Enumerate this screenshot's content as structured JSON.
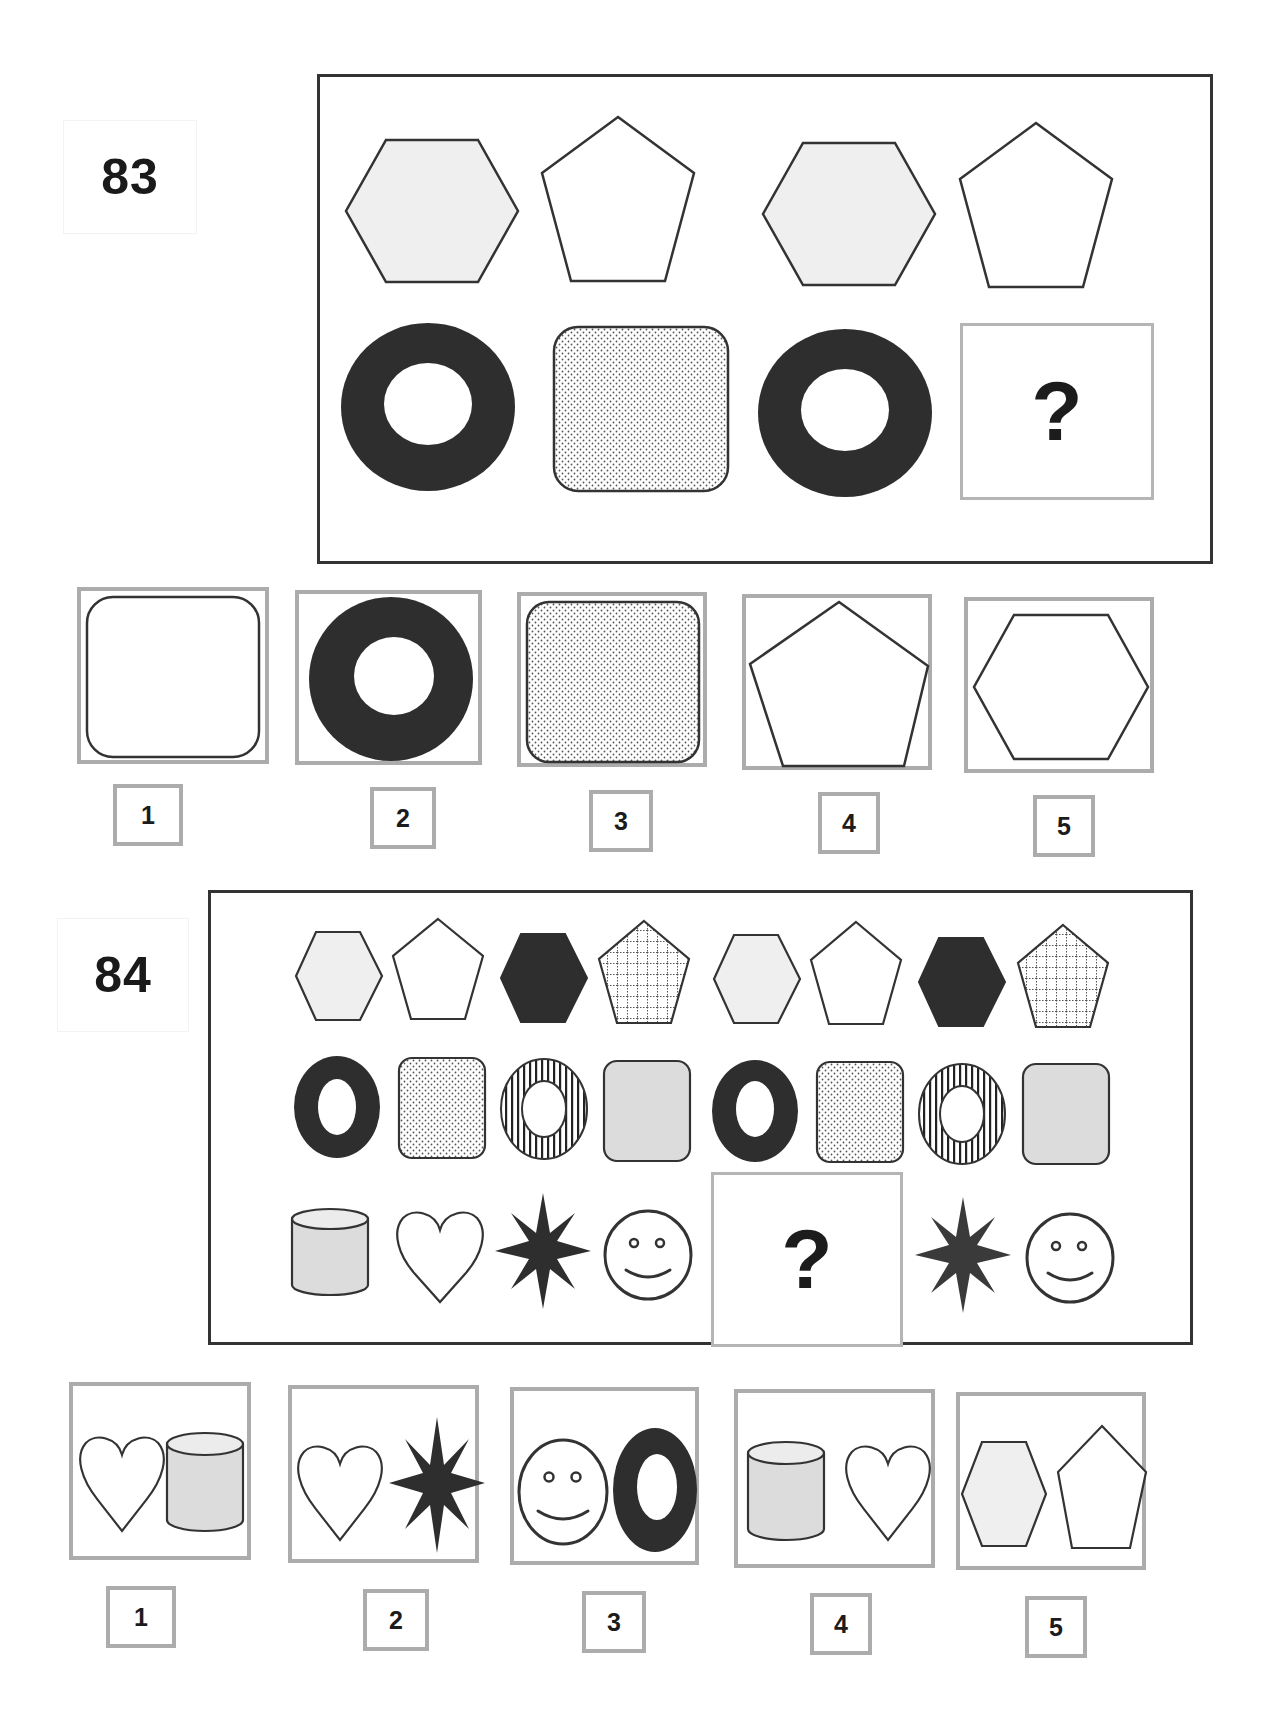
{
  "colors": {
    "outline": "#333333",
    "dark_fill": "#2e2e2e",
    "light_gray_fill": "#efefef",
    "medium_gray_fill": "#dcdcdc",
    "option_border": "#acacac",
    "question_border": "#b5b5b5"
  },
  "puzzles": [
    {
      "number": "83",
      "question_mark": "?",
      "grid": [
        [
          "hexagon-lightgray",
          "pentagon-white",
          "hexagon-lightgray",
          "pentagon-white"
        ],
        [
          "ring-dark",
          "rounded-square-dotted",
          "ring-dark",
          "missing"
        ]
      ],
      "options": [
        {
          "label": "1",
          "content": [
            "rounded-square-white"
          ]
        },
        {
          "label": "2",
          "content": [
            "ring-dark"
          ]
        },
        {
          "label": "3",
          "content": [
            "rounded-square-dotted"
          ]
        },
        {
          "label": "4",
          "content": [
            "pentagon-white"
          ]
        },
        {
          "label": "5",
          "content": [
            "hexagon-white"
          ]
        }
      ]
    },
    {
      "number": "84",
      "question_mark": "?",
      "grid": [
        [
          "hexagon-lightgray",
          "pentagon-white",
          "hexagon-dark",
          "pentagon-grid",
          "hexagon-lightgray",
          "pentagon-white",
          "hexagon-dark",
          "pentagon-grid"
        ],
        [
          "ring-dark",
          "rounded-rect-dotted",
          "ring-striped",
          "rounded-rect-gray",
          "ring-dark",
          "rounded-rect-dotted",
          "ring-striped",
          "rounded-rect-gray"
        ],
        [
          "cylinder-gray",
          "heart-white",
          "star-dark",
          "smiley-face",
          "missing",
          "missing",
          "star-dark",
          "smiley-face"
        ]
      ],
      "options": [
        {
          "label": "1",
          "content": [
            "heart-white",
            "cylinder-gray"
          ]
        },
        {
          "label": "2",
          "content": [
            "heart-white",
            "star-dark"
          ]
        },
        {
          "label": "3",
          "content": [
            "smiley-face",
            "ring-dark"
          ]
        },
        {
          "label": "4",
          "content": [
            "cylinder-gray",
            "heart-white"
          ]
        },
        {
          "label": "5",
          "content": [
            "hexagon-lightgray",
            "pentagon-white"
          ]
        }
      ]
    }
  ]
}
